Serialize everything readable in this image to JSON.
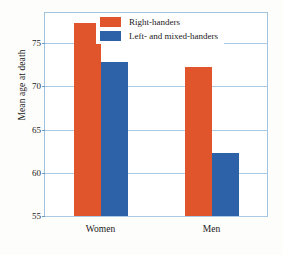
{
  "chart_data": {
    "type": "bar",
    "title": "",
    "xlabel": "",
    "ylabel": "Mean age at death",
    "categories": [
      "Women",
      "Men"
    ],
    "series": [
      {
        "name": "Right-handers",
        "color": "#e0552b",
        "values": [
          77.3,
          72.3
        ]
      },
      {
        "name": "Left- and mixed-handers",
        "color": "#2e62a8",
        "values": [
          72.8,
          62.3
        ]
      }
    ],
    "ylim": [
      55,
      78.5
    ],
    "yticks": [
      55,
      60,
      65,
      70,
      75
    ],
    "ytick_labels": [
      "55",
      "60",
      "65",
      "70",
      "75"
    ],
    "grid": true,
    "legend_position": "top-center"
  },
  "legend": {
    "items": [
      {
        "label": "Right-handers",
        "color": "#e0552b"
      },
      {
        "label": "Left- and mixed-handers",
        "color": "#2e62a8"
      }
    ]
  },
  "axis": {
    "y_title": "Mean age at death"
  },
  "colors": {
    "right_handers": "#e0552b",
    "left_handers": "#2e62a8",
    "grid": "#a9cbe6",
    "frame": "#9fc3e0",
    "background": "#fdfdfb",
    "text": "#1b1b1b"
  }
}
